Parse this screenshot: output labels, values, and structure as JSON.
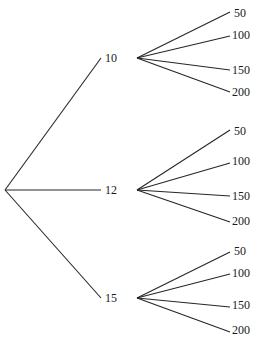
{
  "diagram": {
    "type": "tree",
    "title": "",
    "background_color": "#ffffff",
    "line_color": "#262626",
    "text_color": "#1a1a1a",
    "root": {
      "label": "",
      "x": 5,
      "y": 190
    },
    "level1": [
      {
        "label": "10",
        "node_x": 137,
        "node_y": 58,
        "label_x": 105,
        "label_y": 52,
        "leaves": [
          {
            "label": "50",
            "end_x": 230,
            "end_y": 12,
            "label_x": 234,
            "label_y": 7
          },
          {
            "label": "100",
            "end_x": 230,
            "end_y": 36,
            "label_x": 232,
            "label_y": 29
          },
          {
            "label": "150",
            "end_x": 230,
            "end_y": 70,
            "label_x": 232,
            "label_y": 64
          },
          {
            "label": "200",
            "end_x": 230,
            "end_y": 92,
            "label_x": 232,
            "label_y": 86
          }
        ]
      },
      {
        "label": "12",
        "node_x": 137,
        "node_y": 190,
        "label_x": 105,
        "label_y": 184,
        "leaves": [
          {
            "label": "50",
            "end_x": 230,
            "end_y": 130,
            "label_x": 234,
            "label_y": 125
          },
          {
            "label": "100",
            "end_x": 230,
            "end_y": 163,
            "label_x": 232,
            "label_y": 155
          },
          {
            "label": "150",
            "end_x": 230,
            "end_y": 196,
            "label_x": 232,
            "label_y": 190
          },
          {
            "label": "200",
            "end_x": 230,
            "end_y": 222,
            "label_x": 232,
            "label_y": 215
          }
        ]
      },
      {
        "label": "15",
        "node_x": 137,
        "node_y": 298,
        "label_x": 105,
        "label_y": 292,
        "leaves": [
          {
            "label": "50",
            "end_x": 230,
            "end_y": 252,
            "label_x": 234,
            "label_y": 245
          },
          {
            "label": "100",
            "end_x": 230,
            "end_y": 274,
            "label_x": 232,
            "label_y": 267
          },
          {
            "label": "150",
            "end_x": 230,
            "end_y": 307,
            "label_x": 232,
            "label_y": 299
          },
          {
            "label": "200",
            "end_x": 230,
            "end_y": 332,
            "label_x": 232,
            "label_y": 324
          }
        ]
      }
    ],
    "root_branch_end_x": 101
  }
}
